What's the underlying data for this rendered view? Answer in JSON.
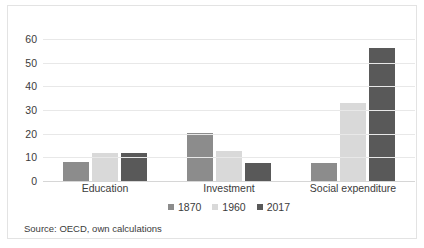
{
  "chart_data": {
    "type": "bar",
    "title": "",
    "subtitle": "",
    "xlabel": "",
    "ylabel": "",
    "categories": [
      "Education",
      "Investment",
      "Social expenditure"
    ],
    "series": [
      {
        "name": "1870",
        "color": "#8c8c8c",
        "values": [
          8.0,
          20.3,
          7.7
        ]
      },
      {
        "name": "1960",
        "color": "#d9d9d9",
        "values": [
          11.7,
          12.5,
          33.0
        ]
      },
      {
        "name": "2017",
        "color": "#595959",
        "values": [
          12.0,
          7.6,
          56.0
        ]
      }
    ],
    "ylim": [
      0,
      60
    ],
    "yticks": [
      0,
      10,
      20,
      30,
      40,
      50,
      60
    ],
    "ytick_labels": [
      "0",
      "10",
      "20",
      "30",
      "40",
      "50",
      "60"
    ],
    "grid": true,
    "legend_position": "bottom"
  },
  "source_note": "Source: OECD, own calculations",
  "colors": {
    "frame": "#e3e3e3",
    "gridline": "#e8e8e8",
    "baseline": "#d6d6d6",
    "text": "#3b3b3b",
    "background": "#ffffff"
  }
}
